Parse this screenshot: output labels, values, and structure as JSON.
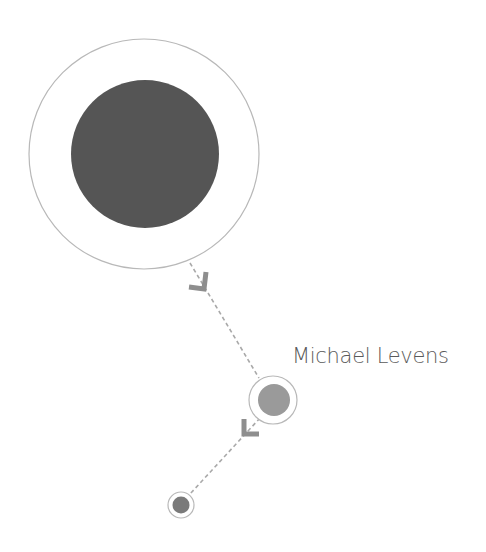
{
  "diagram": {
    "type": "node-path",
    "colors": {
      "background": "#ffffff",
      "ring_stroke": "#b8b8b8",
      "edge_stroke": "#a9a9a9",
      "arrow_fill": "#8e8e8e",
      "label_text": "#5a5a5a"
    },
    "nodes": [
      {
        "id": "node-large",
        "cx": 144,
        "cy": 154,
        "ring_r": 115,
        "fill_r": 74,
        "fill": "#555555"
      },
      {
        "id": "node-medium",
        "cx": 273,
        "cy": 400,
        "ring_r": 24,
        "fill_r": 16,
        "fill": "#9a9a9a",
        "label": "Michael Levens"
      },
      {
        "id": "node-small",
        "cx": 181,
        "cy": 505,
        "ring_r": 13,
        "fill_r": 9,
        "fill": "#7a7a7a"
      }
    ],
    "edges": [
      {
        "from": "node-large",
        "to": "node-medium",
        "style": "dashed",
        "arrow": "down-right"
      },
      {
        "from": "node-medium",
        "to": "node-small",
        "style": "dashed",
        "arrow": "down-left"
      }
    ]
  },
  "labels": {
    "current_node": "Michael Levens"
  }
}
